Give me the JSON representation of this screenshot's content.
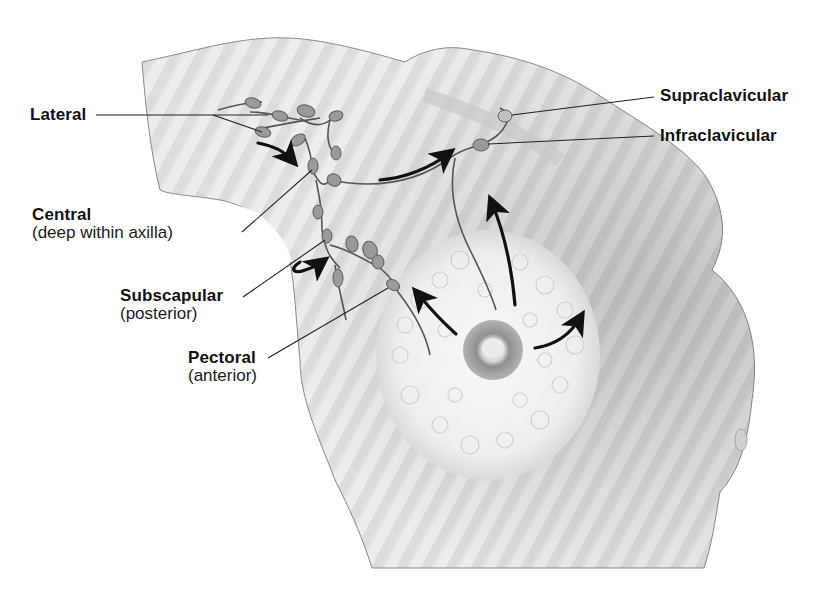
{
  "figure": {
    "colors": {
      "skin_light": "#f3f3f3",
      "skin_mid": "#d6d6d6",
      "skin_dark": "#a9a9a9",
      "outline": "#7a7a7a",
      "node_fill": "#9a9a9a",
      "node_stroke": "#5c5c5c",
      "vessel": "#555555",
      "arrow": "#111111",
      "leader_line": "#222222",
      "text": "#111111"
    }
  },
  "labels": {
    "lateral": {
      "name": "Lateral"
    },
    "central": {
      "name": "Central",
      "sub": "(deep within axilla)"
    },
    "subscapular": {
      "name": "Subscapular",
      "sub": "(posterior)"
    },
    "pectoral": {
      "name": "Pectoral",
      "sub": "(anterior)"
    },
    "supraclavicular": {
      "name": "Supraclavicular"
    },
    "infraclavicular": {
      "name": "Infraclavicular"
    }
  },
  "arrows": [
    {
      "id": "lateral-to-central",
      "description": "curved arrow from lateral nodes down toward central nodes"
    },
    {
      "id": "central-to-infraclavicular",
      "description": "arrow from central nodes to infraclavicular node"
    },
    {
      "id": "subscapular-loop",
      "description": "curved arrow near subscapular nodes"
    },
    {
      "id": "breast-to-pectoral",
      "description": "arrow from nipple area up-left toward pectoral nodes"
    },
    {
      "id": "breast-upward",
      "description": "arrow from upper breast upward toward infraclavicular"
    },
    {
      "id": "breast-medial",
      "description": "arrow from nipple area curving up-right"
    }
  ]
}
